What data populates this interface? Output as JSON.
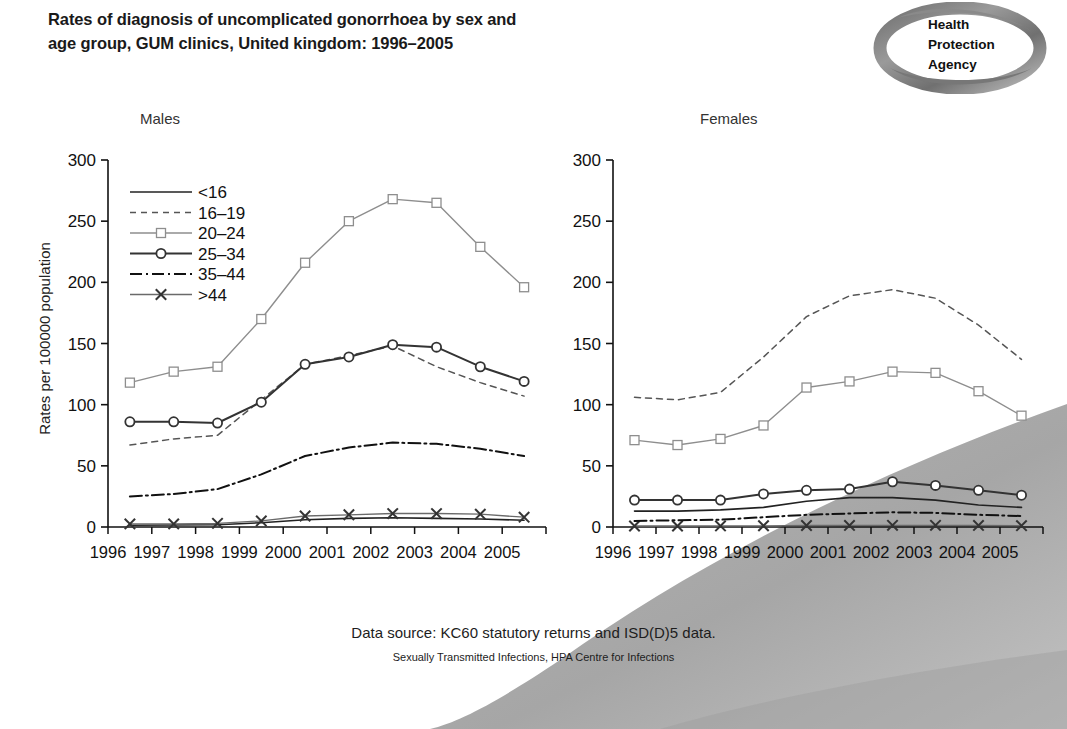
{
  "header": {
    "title_line1": "Rates of diagnosis of uncomplicated gonorrhoea by sex and",
    "title_line2": "age group, GUM clinics, United kingdom: 1996–2005"
  },
  "logo": {
    "name": "Health Protection Agency",
    "line1": "Health",
    "line2": "Protection",
    "line3": "Agency",
    "ring_color": "#8d8d8d"
  },
  "footer": {
    "source": "Data source: KC60 statutory returns and ISD(D)5 data.",
    "credit": "Sexually Transmitted Infections, HPA Centre for Infections"
  },
  "axis": {
    "ylabel": "Rates per 100000 population",
    "yticks": [
      0,
      50,
      100,
      150,
      200,
      250,
      300
    ],
    "ylim": [
      0,
      300
    ],
    "xticks": [
      "1996",
      "1997",
      "1998",
      "1999",
      "2000",
      "2001",
      "2002",
      "2003",
      "2004",
      "2005"
    ],
    "xlim": [
      1996,
      2005
    ]
  },
  "legend": {
    "position": "upper-left of Males panel",
    "entries": [
      {
        "label": "<16",
        "style": "solid",
        "marker": "none"
      },
      {
        "label": "16–19",
        "style": "dashed",
        "marker": "none"
      },
      {
        "label": "20–24",
        "style": "solid-light",
        "marker": "square"
      },
      {
        "label": "25–34",
        "style": "solid-dark",
        "marker": "circle"
      },
      {
        "label": "35–44",
        "style": "dashdot",
        "marker": "none"
      },
      {
        "label": ">44",
        "style": "solid-grey",
        "marker": "x"
      }
    ]
  },
  "chart_data": [
    {
      "type": "line",
      "title": "Males",
      "xlabel": "",
      "ylabel": "Rates per 100000 population",
      "x": [
        1996,
        1997,
        1998,
        1999,
        2000,
        2001,
        2002,
        2003,
        2004,
        2005
      ],
      "ylim": [
        0,
        300
      ],
      "grid": false,
      "series": [
        {
          "name": "<16",
          "values": [
            1.5,
            1.6,
            1.8,
            3.5,
            6.0,
            7.0,
            7.5,
            7.0,
            6.5,
            5.5
          ]
        },
        {
          "name": "16–19",
          "values": [
            67,
            72,
            75,
            104,
            133,
            140,
            148,
            131,
            118,
            107
          ]
        },
        {
          "name": "20–24",
          "values": [
            118,
            127,
            131,
            170,
            216,
            250,
            268,
            265,
            229,
            196
          ]
        },
        {
          "name": "25–34",
          "values": [
            86,
            86,
            85,
            102,
            133,
            139,
            149,
            147,
            131,
            119
          ]
        },
        {
          "name": "35–44",
          "values": [
            25,
            27,
            31,
            43,
            58,
            65,
            69,
            68,
            64,
            58
          ]
        },
        {
          "name": ">44",
          "values": [
            2.5,
            2.5,
            3.0,
            5.0,
            9.0,
            10.0,
            11.0,
            11.0,
            10.5,
            8.0
          ]
        }
      ]
    },
    {
      "type": "line",
      "title": "Females",
      "xlabel": "",
      "ylabel": "",
      "x": [
        1996,
        1997,
        1998,
        1999,
        2000,
        2001,
        2002,
        2003,
        2004,
        2005
      ],
      "ylim": [
        0,
        300
      ],
      "grid": false,
      "series": [
        {
          "name": "<16",
          "values": [
            13,
            13,
            14,
            16,
            21,
            24,
            24,
            22,
            18,
            16
          ]
        },
        {
          "name": "16–19",
          "values": [
            106,
            104,
            110,
            139,
            172,
            189,
            194,
            187,
            165,
            137
          ]
        },
        {
          "name": "20–24",
          "values": [
            71,
            67,
            72,
            83,
            114,
            119,
            127,
            126,
            111,
            91
          ]
        },
        {
          "name": "25–34",
          "values": [
            22,
            22,
            22,
            27,
            30,
            31,
            37,
            34,
            30,
            26
          ]
        },
        {
          "name": "35–44",
          "values": [
            5,
            5.5,
            6,
            8,
            10,
            11,
            12,
            11.5,
            10,
            9
          ]
        },
        {
          "name": ">44",
          "values": [
            0.8,
            0.8,
            0.9,
            1.0,
            1.2,
            1.3,
            1.4,
            1.4,
            1.3,
            1.1
          ]
        }
      ]
    }
  ]
}
